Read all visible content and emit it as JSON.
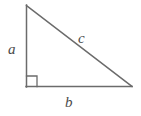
{
  "figure": {
    "name": "right-triangle-diagram",
    "background_color": "#ffffff",
    "stroke_color": "#6b6b6b",
    "label_color": "#4a4a4a",
    "stroke_width": 1.5,
    "width": 141,
    "height": 116
  },
  "triangle": {
    "vertices": {
      "apex": {
        "x": 26,
        "y": 5
      },
      "right_angle": {
        "x": 26,
        "y": 87
      },
      "base_right": {
        "x": 132,
        "y": 87
      }
    },
    "right_angle_marker": {
      "x": 26,
      "y": 76,
      "size": 11
    }
  },
  "labels": {
    "leg_vertical": "a",
    "hypotenuse": "c",
    "leg_horizontal": "b"
  }
}
